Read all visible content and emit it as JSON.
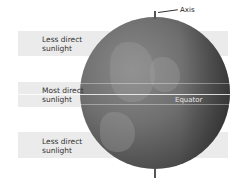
{
  "diagram": {
    "axis_label": "Axis",
    "equator_label": "Equator",
    "bands": [
      {
        "label_line1": "Less direct",
        "label_line2": "sunlight"
      },
      {
        "label_line1": "Most direct",
        "label_line2": "sunlight"
      },
      {
        "label_line1": "Less direct",
        "label_line2": "sunlight"
      }
    ],
    "colors": {
      "band": "#ebebeb",
      "globe_dark": "#2e2e2e",
      "globe_light": "#8a8a8a",
      "text": "#333333"
    }
  }
}
